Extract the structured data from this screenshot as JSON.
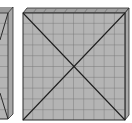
{
  "diagram": {
    "colors": {
      "face": "#b4b4b4",
      "grid": "#6e6e6e",
      "edge": "#2a2a2a",
      "bevel": "#9a9a9a",
      "background": "#ffffff"
    },
    "shapes": [
      {
        "id": "left-slab",
        "visible": "partial",
        "grid_cells": 10
      },
      {
        "id": "center-slab",
        "visible": "full",
        "grid_cells": 10,
        "diagonals": true
      }
    ]
  }
}
